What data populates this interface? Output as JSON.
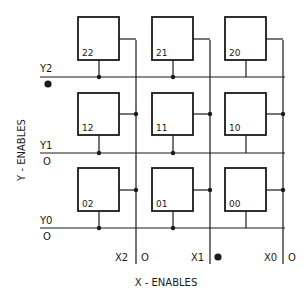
{
  "diagram": {
    "type": "3x3 coincident-selection matrix",
    "cells": [
      {
        "id": "22",
        "label": "22",
        "row": 0,
        "col": 0
      },
      {
        "id": "21",
        "label": "21",
        "row": 0,
        "col": 1
      },
      {
        "id": "20",
        "label": "20",
        "row": 0,
        "col": 2
      },
      {
        "id": "12",
        "label": "12",
        "row": 1,
        "col": 0
      },
      {
        "id": "11",
        "label": "11",
        "row": 1,
        "col": 1
      },
      {
        "id": "10",
        "label": "10",
        "row": 1,
        "col": 2
      },
      {
        "id": "02",
        "label": "02",
        "row": 2,
        "col": 0
      },
      {
        "id": "01",
        "label": "01",
        "row": 2,
        "col": 1
      },
      {
        "id": "00",
        "label": "00",
        "row": 2,
        "col": 2
      }
    ],
    "y_lines": [
      {
        "label": "Y2",
        "state": "●",
        "active": true
      },
      {
        "label": "Y1",
        "state": "O",
        "active": false
      },
      {
        "label": "Y0",
        "state": "O",
        "active": false
      }
    ],
    "x_lines": [
      {
        "label": "X2",
        "state": "O",
        "active": false
      },
      {
        "label": "X1",
        "state": "●",
        "active": true
      },
      {
        "label": "X0",
        "state": "O",
        "active": false
      }
    ],
    "y_axis_title": "Y - ENABLES",
    "x_axis_title": "X - ENABLES",
    "colors": {
      "line": "#1a1a1a",
      "background": "#ffffff"
    }
  }
}
